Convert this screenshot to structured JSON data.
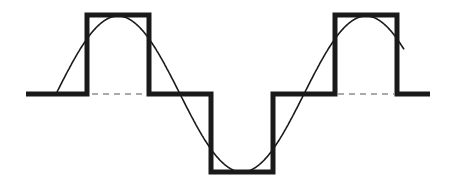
{
  "diagram": {
    "title": "",
    "colors": {
      "background": "#ffffff",
      "stroke": "#1a1a1a",
      "dash": "#555555"
    },
    "baseline_y": 94,
    "square_wave": {
      "stroke_width": 5,
      "points": [
        [
          26,
          94
        ],
        [
          87,
          94
        ],
        [
          87,
          15
        ],
        [
          149,
          15
        ],
        [
          149,
          94
        ],
        [
          211,
          94
        ],
        [
          211,
          172
        ],
        [
          273,
          172
        ],
        [
          273,
          94
        ],
        [
          335,
          94
        ],
        [
          335,
          15
        ],
        [
          397,
          15
        ],
        [
          397,
          94
        ],
        [
          430,
          94
        ]
      ]
    },
    "sine_wave": {
      "stroke_width": 1.6,
      "start_x": 56,
      "end_x": 404,
      "center_y": 94,
      "amplitude": 78,
      "period": 248,
      "phase_x": 56
    },
    "dashed_segments": [
      {
        "x1": 92,
        "x2": 146
      },
      {
        "x1": 152,
        "x2": 208
      },
      {
        "x1": 276,
        "x2": 332
      },
      {
        "x1": 338,
        "x2": 394
      }
    ]
  }
}
